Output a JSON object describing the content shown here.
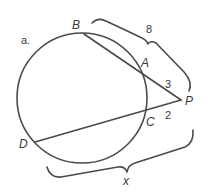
{
  "figure": {
    "part_label": "a.",
    "colors": {
      "line": "#4a4a4a",
      "text": "#3a3a3a",
      "background": "#ffffff"
    },
    "circle": {
      "cx": 82,
      "cy": 98,
      "r": 65
    },
    "points": {
      "B": {
        "label": "B",
        "x": 84,
        "y": 34
      },
      "A": {
        "label": "A",
        "x": 141,
        "y": 70
      },
      "P": {
        "label": "P",
        "x": 181,
        "y": 100
      },
      "C": {
        "label": "C",
        "x": 144,
        "y": 111
      },
      "D": {
        "label": "D",
        "x": 35,
        "y": 142
      }
    },
    "segments": [
      {
        "name": "secant-PB",
        "from": "P",
        "to": "B"
      },
      {
        "name": "secant-PD",
        "from": "P",
        "to": "D"
      }
    ],
    "measures": {
      "PB": "8",
      "PA": "3",
      "PC": "2",
      "PD": "x"
    }
  }
}
